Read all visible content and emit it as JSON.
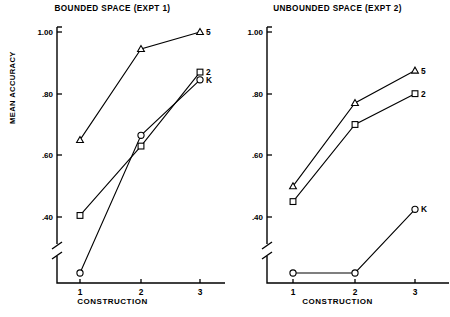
{
  "figure": {
    "y_axis_title": "MEAN ACCURACY",
    "x_axis_title": "CONSTRUCTION"
  },
  "panels": [
    {
      "id": "bounded",
      "title": "BOUNDED SPACE (EXPT 1)",
      "x_axis_title": "CONSTRUCTION",
      "x_tick_labels": [
        "1",
        "2",
        "3"
      ],
      "y_tick_labels": [
        "1.00",
        ".80",
        ".60",
        ".40"
      ],
      "series_labels": {
        "s5": "5",
        "s2": "2",
        "sK": "K"
      }
    },
    {
      "id": "unbounded",
      "title": "UNBOUNDED SPACE (EXPT 2)",
      "x_axis_title": "CONSTRUCTION",
      "x_tick_labels": [
        "1",
        "2",
        "3"
      ],
      "y_tick_labels": [
        "1.00",
        ".80",
        ".60",
        ".40"
      ],
      "series_labels": {
        "s5": "5",
        "s2": "2",
        "sK": "K"
      }
    }
  ],
  "chart_data": [
    {
      "type": "line",
      "title": "BOUNDED SPACE (EXPT 1)",
      "xlabel": "CONSTRUCTION",
      "ylabel": "MEAN ACCURACY",
      "categories": [
        "1",
        "2",
        "3"
      ],
      "x": [
        1,
        2,
        3
      ],
      "ylim": [
        0.26,
        1.02
      ],
      "yticks": [
        1.0,
        0.8,
        0.6,
        0.4
      ],
      "ytick_labels": [
        "1.00",
        ".80",
        ".60",
        ".40"
      ],
      "y_axis_break": true,
      "grid": false,
      "legend": "at-line-end",
      "series": [
        {
          "name": "5",
          "marker": "triangle",
          "values": [
            0.65,
            0.945,
            1.0
          ]
        },
        {
          "name": "2",
          "marker": "square",
          "values": [
            0.405,
            0.63,
            0.87
          ]
        },
        {
          "name": "K",
          "marker": "circle",
          "values": [
            0.33,
            0.665,
            0.845
          ]
        }
      ]
    },
    {
      "type": "line",
      "title": "UNBOUNDED SPACE (EXPT 2)",
      "xlabel": "CONSTRUCTION",
      "ylabel": "MEAN ACCURACY",
      "categories": [
        "1",
        "2",
        "3"
      ],
      "x": [
        1,
        2,
        3
      ],
      "ylim": [
        0.26,
        1.02
      ],
      "yticks": [
        1.0,
        0.8,
        0.6,
        0.4
      ],
      "ytick_labels": [
        "1.00",
        ".80",
        ".60",
        ".40"
      ],
      "y_axis_break": true,
      "grid": false,
      "legend": "at-line-end",
      "series": [
        {
          "name": "5",
          "marker": "triangle",
          "values": [
            0.5,
            0.77,
            0.875
          ]
        },
        {
          "name": "2",
          "marker": "square",
          "values": [
            0.45,
            0.7,
            0.8
          ]
        },
        {
          "name": "K",
          "marker": "circle",
          "values": [
            0.27,
            0.345,
            0.425
          ]
        }
      ]
    }
  ]
}
